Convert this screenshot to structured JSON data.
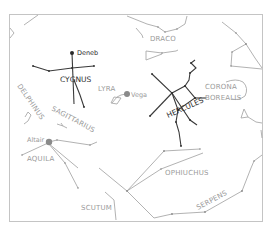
{
  "map": {
    "type": "star-chart",
    "constellations": [
      {
        "name": "DRACO",
        "emphasis": "normal"
      },
      {
        "name": "CYGNUS",
        "emphasis": "highlighted"
      },
      {
        "name": "LYRA",
        "emphasis": "normal"
      },
      {
        "name": "HERCULES",
        "emphasis": "highlighted"
      },
      {
        "name": "CORONA BOREALIS",
        "lines": [
          "CORONA",
          "BOREALIS"
        ],
        "emphasis": "normal"
      },
      {
        "name": "DELPHINUS",
        "emphasis": "normal"
      },
      {
        "name": "SAGITTARIUS",
        "emphasis": "normal"
      },
      {
        "name": "AQUILA",
        "emphasis": "normal"
      },
      {
        "name": "OPHIUCHUS",
        "emphasis": "normal"
      },
      {
        "name": "SERPENS",
        "emphasis": "normal"
      },
      {
        "name": "SCUTUM",
        "emphasis": "normal"
      }
    ],
    "bright_stars": [
      {
        "name": "Deneb",
        "constellation": "CYGNUS"
      },
      {
        "name": "Vega",
        "constellation": "LYRA"
      },
      {
        "name": "Altair",
        "constellation": "AQUILA"
      }
    ],
    "colors": {
      "highlight": "#2a2a2a",
      "normal": "#9a9a9a",
      "frame": "#c4c4c4"
    }
  }
}
